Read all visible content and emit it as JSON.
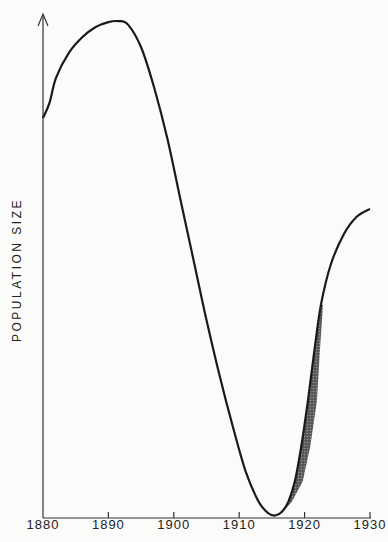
{
  "chart_data": {
    "type": "line",
    "title": "",
    "xlabel": "",
    "ylabel": "POPULATION SIZE",
    "xlim": [
      1880,
      1930
    ],
    "ylim": [
      0,
      100
    ],
    "x_ticks": [
      "1880",
      "1890",
      "1900",
      "1910",
      "1920",
      "1930"
    ],
    "grid": false,
    "legend": null,
    "series": [
      {
        "name": "population",
        "x": [
          1880,
          1881,
          1882,
          1884,
          1886,
          1888,
          1890,
          1891.5,
          1893,
          1895,
          1897,
          1899,
          1901,
          1903,
          1905,
          1907,
          1909,
          1911,
          1913,
          1914.5,
          1915.5,
          1916.5,
          1917.5,
          1918.5,
          1919.5,
          1920.5,
          1921.5,
          1922.5,
          1924,
          1926,
          1928,
          1930
        ],
        "values": [
          79,
          82,
          87,
          92,
          95,
          97,
          98,
          98.2,
          97.5,
          93,
          85,
          75,
          63,
          51,
          39,
          28,
          18,
          9,
          3,
          0.7,
          0.3,
          1,
          3,
          7,
          14,
          23,
          33,
          42,
          50,
          56,
          59.5,
          61
        ]
      }
    ],
    "annotations": [
      {
        "type": "shaded_band",
        "x_range": [
          1915,
          1922
        ],
        "description": "stippled band of uncertainty around recovery"
      }
    ]
  }
}
